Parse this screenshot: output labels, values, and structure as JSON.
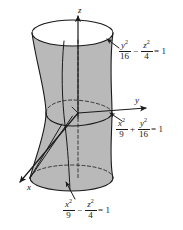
{
  "figure": {
    "surface_type": "hyperboloid-of-one-sheet",
    "fill_color": "#b9b9b9",
    "outline_color": "#1a1a1a",
    "opening_color": "#ffffff",
    "background_color": "#ffffff"
  },
  "axes": {
    "z": {
      "label": "z",
      "direction": "up"
    },
    "y": {
      "label": "y",
      "direction": "right"
    },
    "x": {
      "label": "x",
      "direction": "down-left"
    }
  },
  "equations": {
    "top": {
      "name": "yz-trace",
      "term1": {
        "numerator": "y",
        "numerator_exponent": "2",
        "denominator": "16"
      },
      "operator": "−",
      "term2": {
        "numerator": "z",
        "numerator_exponent": "2",
        "denominator": "4"
      },
      "equals": "= 1",
      "plain": "y^2/16 - z^2/4 = 1"
    },
    "middle": {
      "name": "xy-trace",
      "term1": {
        "numerator": "x",
        "numerator_exponent": "2",
        "denominator": "9"
      },
      "operator": "+",
      "term2": {
        "numerator": "y",
        "numerator_exponent": "2",
        "denominator": "16"
      },
      "equals": "= 1",
      "plain": "x^2/9 + y^2/16 = 1"
    },
    "bottom": {
      "name": "xz-trace",
      "term1": {
        "numerator": "x",
        "numerator_exponent": "2",
        "denominator": "9"
      },
      "operator": "−",
      "term2": {
        "numerator": "z",
        "numerator_exponent": "2",
        "denominator": "4"
      },
      "equals": "= 1",
      "plain": "x^2/9 - z^2/4 = 1"
    }
  }
}
